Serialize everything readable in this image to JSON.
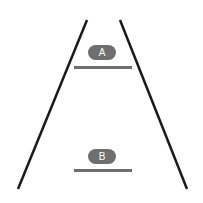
{
  "diagram": {
    "shape": "trapezoid-perspective",
    "colors": {
      "edge": "#1a1a1a",
      "marker": "#6f6f6f",
      "label_text": "#ffffff",
      "background": "#ffffff"
    },
    "edges": [
      {
        "name": "left-edge",
        "x1": 87,
        "y1": 20,
        "x2": 18,
        "y2": 189
      },
      {
        "name": "right-edge",
        "x1": 120,
        "y1": 20,
        "x2": 187,
        "y2": 189
      }
    ],
    "levels": [
      {
        "label": "A",
        "line_y": 67
      },
      {
        "label": "B",
        "line_y": 170
      }
    ]
  }
}
